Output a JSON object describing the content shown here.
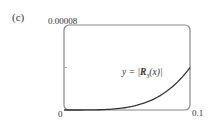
{
  "panel_label": "(c)",
  "chart_data": {
    "type": "line",
    "title": "",
    "xlabel": "",
    "ylabel": "",
    "xlim": [
      0,
      0.1
    ],
    "ylim": [
      0,
      8e-05
    ],
    "x_tick_labels": [
      "0",
      "0.1"
    ],
    "y_tick_labels": [
      "0.00008"
    ],
    "y_ticks": [
      4e-05
    ],
    "grid": false,
    "series": [
      {
        "name": "y = |R3(x)|",
        "x": [
          0,
          0.01,
          0.02,
          0.03,
          0.04,
          0.05,
          0.06,
          0.07,
          0.08,
          0.09,
          0.1
        ],
        "y": [
          0,
          4e-09,
          6e-08,
          3e-07,
          9.6e-07,
          2.3e-06,
          4.9e-06,
          9.1e-06,
          1.55e-05,
          2.49e-05,
          4e-05
        ]
      }
    ],
    "annotations": [
      {
        "text": "y = |R3(x)|",
        "x": 0.055,
        "y": 2.5e-05
      }
    ]
  },
  "labels": {
    "y_max": "0.00008",
    "x_min": "0",
    "x_max": "0.1",
    "eq_prefix": "y = |",
    "eq_R": "R",
    "eq_sub": "3",
    "eq_suffix": "(x)|"
  }
}
